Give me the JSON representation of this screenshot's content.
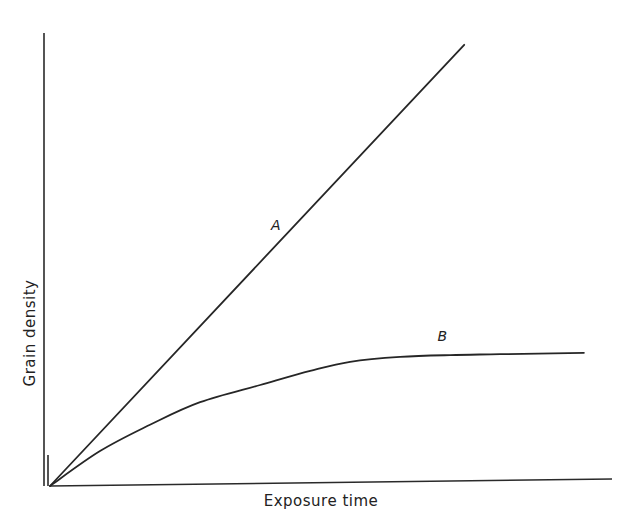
{
  "chart_data": {
    "type": "line",
    "title": "",
    "xlabel": "Exposure time",
    "ylabel": "Grain density",
    "xlim": [
      0,
      100
    ],
    "ylim": [
      0,
      100
    ],
    "grid": false,
    "legend": "none (inline labels)",
    "ticks": "none",
    "series": [
      {
        "name": "A",
        "label_position": {
          "x": 40.2,
          "y": 56.5
        },
        "x": [
          0,
          73.7
        ],
        "y": [
          0,
          97.4
        ]
      },
      {
        "name": "B",
        "label_position": {
          "x": 69.8,
          "y": 32.0
        },
        "x": [
          0,
          8.9,
          17.8,
          26.7,
          37.4,
          46.3,
          53.4,
          62.3,
          71.2,
          80.1,
          95.0
        ],
        "y": [
          0,
          7.7,
          13.5,
          18.5,
          22.3,
          25.4,
          27.4,
          28.5,
          28.9,
          29.1,
          29.4
        ]
      }
    ]
  },
  "colors": {
    "background": "#ffffff",
    "ink": "#262626"
  }
}
